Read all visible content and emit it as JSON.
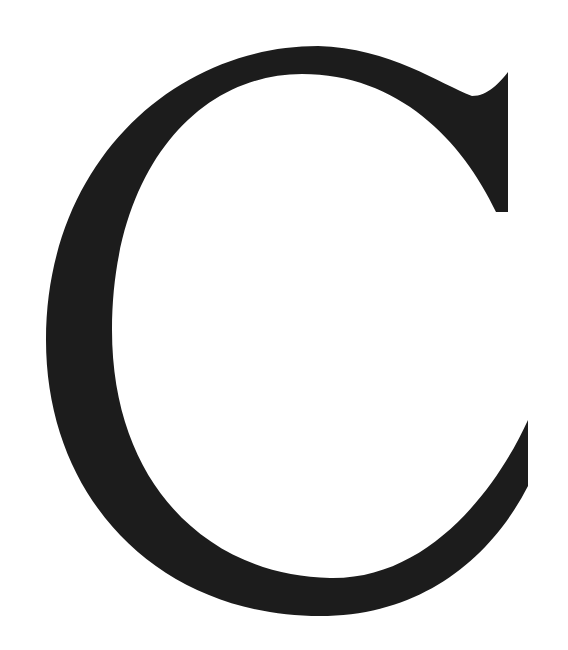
{
  "glyph": {
    "character": "C",
    "style": "serif",
    "fill_color": "#1c1c1c",
    "background_color": "#ffffff"
  }
}
